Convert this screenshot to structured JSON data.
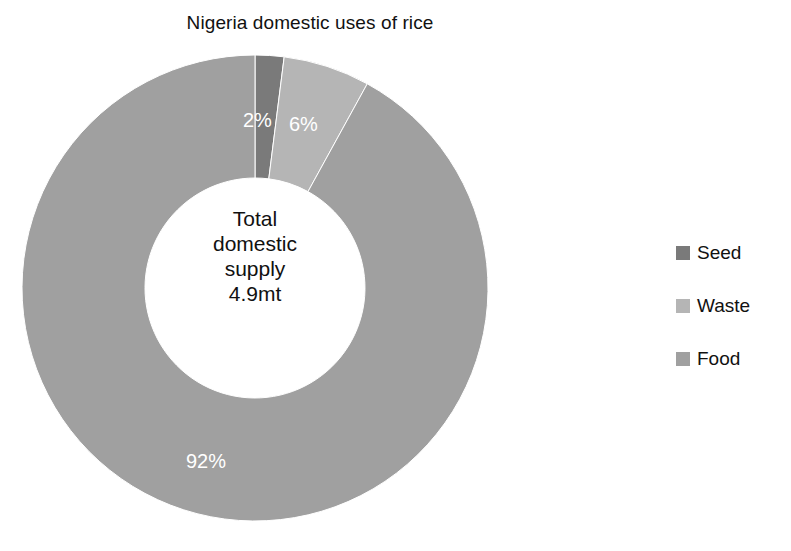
{
  "chart_data": {
    "type": "pie",
    "variant": "donut",
    "title": "Nigeria domestic uses of rice",
    "xlabel": "",
    "ylabel": "",
    "grid": false,
    "legend_position": "right",
    "value_unit": "%",
    "center_label": {
      "lines": [
        "Total",
        "domestic",
        "supply",
        "4.9mt"
      ],
      "total_value": "4.9",
      "total_unit": "mt"
    },
    "categories": [
      "Seed",
      "Waste",
      "Food"
    ],
    "values": [
      2,
      6,
      92
    ],
    "data_labels": [
      "2%",
      "6%",
      "92%"
    ],
    "colors": [
      "#7a7a7a",
      "#b5b5b5",
      "#a0a0a0"
    ],
    "slices": [
      {
        "label": "Seed",
        "value": 2,
        "data_label": "2%",
        "color": "#7a7a7a"
      },
      {
        "label": "Waste",
        "value": 6,
        "data_label": "6%",
        "color": "#b5b5b5"
      },
      {
        "label": "Food",
        "value": 92,
        "data_label": "92%",
        "color": "#a0a0a0"
      }
    ]
  },
  "title": "Nigeria domestic uses of rice",
  "center": {
    "line1": "Total",
    "line2": "domestic",
    "line3": "supply",
    "line4": "4.9mt"
  },
  "labels": {
    "seed": "2%",
    "waste": "6%",
    "food": "92%"
  },
  "legend": {
    "items": [
      {
        "label": "Seed",
        "color": "#7a7a7a"
      },
      {
        "label": "Waste",
        "color": "#b5b5b5"
      },
      {
        "label": "Food",
        "color": "#a0a0a0"
      }
    ]
  }
}
